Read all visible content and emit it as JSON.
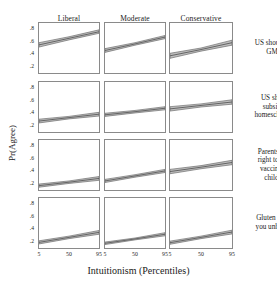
{
  "figure": {
    "x_axis_title": "Intuitionism (Percentiles)",
    "y_axis_title": "Pr(Agree)",
    "column_titles": [
      "Liberal",
      "Moderate",
      "Conservative"
    ],
    "row_labels": [
      "US should ban GMOs",
      "US should subsidize homeschoolers",
      "Parents have right to deny vaccines to children",
      "Gluten makes you unhealthy"
    ],
    "row_labels_lines": [
      [
        "US should ban",
        "GMOs"
      ],
      [
        "US should",
        "subsidize",
        "homeschoolers"
      ],
      [
        "Parents have",
        "right to deny",
        "vaccines to",
        "children"
      ],
      [
        "Gluten makes",
        "you unhealthy"
      ]
    ],
    "y_ticks": [
      ".8",
      ".6",
      ".4",
      ".2"
    ],
    "x_ticks": [
      "5",
      "50",
      "95"
    ],
    "band_fill": "#b3b3b3",
    "band_stroke": "#6e6e6e",
    "line_color": "#5a5a5a",
    "panel_border": "#8a8a8a"
  },
  "chart_data": {
    "type": "line",
    "title": "",
    "subtitle": "",
    "xlabel": "Intuitionism (Percentiles)",
    "ylabel": "Pr(Agree)",
    "xlim": [
      5,
      95
    ],
    "ylim": [
      0.1,
      0.9
    ],
    "x_tick_values": [
      5,
      50,
      95
    ],
    "y_tick_values": [
      0.2,
      0.4,
      0.6,
      0.8
    ],
    "grid": false,
    "legend": "none",
    "facet_columns": [
      "Liberal",
      "Moderate",
      "Conservative"
    ],
    "facet_rows": [
      "US should ban GMOs",
      "US should subsidize homeschoolers",
      "Parents have right to deny vaccines to children",
      "Gluten makes you unhealthy"
    ],
    "x": [
      5,
      50,
      95
    ],
    "panels": [
      {
        "row": "US should ban GMOs",
        "column": "Liberal",
        "fit": [
          0.55,
          0.655,
          0.76
        ],
        "ci_lower": [
          0.515,
          0.63,
          0.735
        ],
        "ci_upper": [
          0.585,
          0.68,
          0.79
        ]
      },
      {
        "row": "US should ban GMOs",
        "column": "Moderate",
        "fit": [
          0.46,
          0.565,
          0.675
        ],
        "ci_lower": [
          0.43,
          0.545,
          0.65
        ],
        "ci_upper": [
          0.49,
          0.585,
          0.7
        ]
      },
      {
        "row": "US should ban GMOs",
        "column": "Conservative",
        "fit": [
          0.375,
          0.475,
          0.585
        ],
        "ci_lower": [
          0.335,
          0.45,
          0.545
        ],
        "ci_upper": [
          0.415,
          0.5,
          0.625
        ]
      },
      {
        "row": "US should subsidize homeschoolers",
        "column": "Liberal",
        "fit": [
          0.275,
          0.33,
          0.385
        ],
        "ci_lower": [
          0.245,
          0.31,
          0.355
        ],
        "ci_upper": [
          0.305,
          0.35,
          0.415
        ]
      },
      {
        "row": "US should subsidize homeschoolers",
        "column": "Moderate",
        "fit": [
          0.375,
          0.425,
          0.48
        ],
        "ci_lower": [
          0.35,
          0.405,
          0.455
        ],
        "ci_upper": [
          0.4,
          0.445,
          0.505
        ]
      },
      {
        "row": "US should subsidize homeschoolers",
        "column": "Conservative",
        "fit": [
          0.47,
          0.525,
          0.58
        ],
        "ci_lower": [
          0.435,
          0.5,
          0.545
        ],
        "ci_upper": [
          0.505,
          0.55,
          0.615
        ]
      },
      {
        "row": "Parents have right to deny vaccines to children",
        "column": "Liberal",
        "fit": [
          0.17,
          0.225,
          0.285
        ],
        "ci_lower": [
          0.145,
          0.205,
          0.255
        ],
        "ci_upper": [
          0.195,
          0.245,
          0.315
        ]
      },
      {
        "row": "Parents have right to deny vaccines to children",
        "column": "Moderate",
        "fit": [
          0.245,
          0.325,
          0.405
        ],
        "ci_lower": [
          0.22,
          0.305,
          0.38
        ],
        "ci_upper": [
          0.27,
          0.345,
          0.43
        ]
      },
      {
        "row": "Parents have right to deny vaccines to children",
        "column": "Conservative",
        "fit": [
          0.395,
          0.465,
          0.54
        ],
        "ci_lower": [
          0.36,
          0.44,
          0.505
        ],
        "ci_upper": [
          0.43,
          0.49,
          0.575
        ]
      },
      {
        "row": "Gluten makes you unhealthy",
        "column": "Liberal",
        "fit": [
          0.19,
          0.27,
          0.35
        ],
        "ci_lower": [
          0.165,
          0.25,
          0.32
        ],
        "ci_upper": [
          0.215,
          0.29,
          0.38
        ]
      },
      {
        "row": "Gluten makes you unhealthy",
        "column": "Moderate",
        "fit": [
          0.175,
          0.245,
          0.32
        ],
        "ci_lower": [
          0.155,
          0.23,
          0.295
        ],
        "ci_upper": [
          0.195,
          0.26,
          0.345
        ]
      },
      {
        "row": "Gluten makes you unhealthy",
        "column": "Conservative",
        "fit": [
          0.185,
          0.27,
          0.355
        ],
        "ci_lower": [
          0.16,
          0.25,
          0.325
        ],
        "ci_upper": [
          0.21,
          0.29,
          0.385
        ]
      }
    ]
  }
}
